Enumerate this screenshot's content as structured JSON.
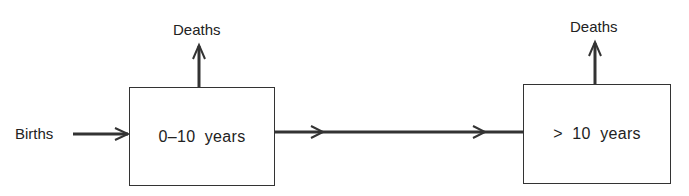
{
  "diagram": {
    "type": "flow",
    "input": {
      "label": "Births"
    },
    "nodes": [
      {
        "id": "young",
        "label": "0–10  years",
        "outflow": "Deaths"
      },
      {
        "id": "old",
        "label": ">  10  years",
        "outflow": "Deaths"
      }
    ],
    "edges": [
      {
        "from": "Births",
        "to": "young"
      },
      {
        "from": "young",
        "to": "old"
      },
      {
        "from": "young",
        "to": "Deaths"
      },
      {
        "from": "old",
        "to": "Deaths"
      }
    ],
    "colors": {
      "line": "#333333",
      "background": "#ffffff"
    }
  }
}
